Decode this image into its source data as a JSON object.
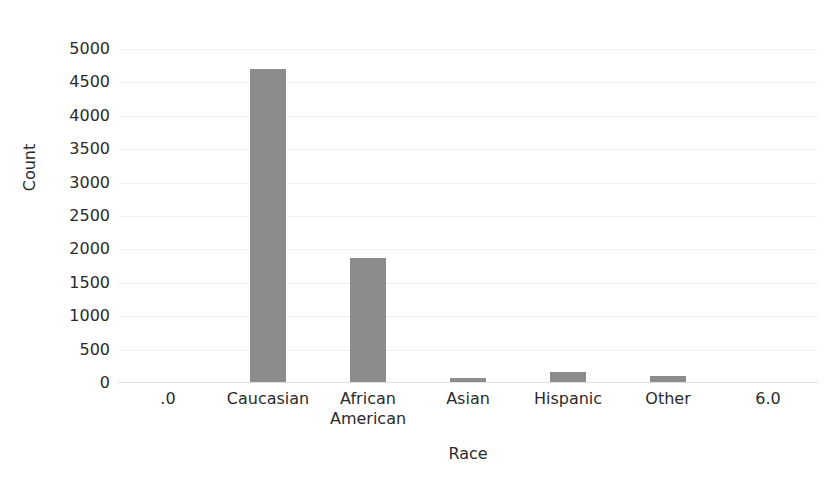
{
  "chart_data": {
    "type": "bar",
    "title": "",
    "subtitle": "",
    "xlabel": "Race",
    "ylabel": "Count",
    "categories": [
      ".0",
      "Caucasian",
      "African American",
      "Asian",
      "Hispanic",
      "Other",
      "6.0"
    ],
    "category_lines": [
      [
        ".0"
      ],
      [
        "Caucasian"
      ],
      [
        "African",
        "American"
      ],
      [
        "Asian"
      ],
      [
        "Hispanic"
      ],
      [
        "Other"
      ],
      [
        "6.0"
      ]
    ],
    "values": [
      0,
      4700,
      1870,
      75,
      165,
      105,
      0
    ],
    "ylim": [
      0,
      5000
    ],
    "ytick_values": [
      0,
      500,
      1000,
      1500,
      2000,
      2500,
      3000,
      3500,
      4000,
      4500,
      5000
    ],
    "ytick_labels": [
      "0",
      "500",
      "1000",
      "1500",
      "2000",
      "2500",
      "3000",
      "3500",
      "4000",
      "4500",
      "5000"
    ],
    "grid": true,
    "grid_axis": "y",
    "legend": false,
    "legend_position": "none",
    "bar_color": "#8c8c8c",
    "grid_color": "#f1f1f1",
    "axis_color": "#e2e2e2",
    "background_color": "#ffffff",
    "text_color": "#2b2b2b"
  }
}
